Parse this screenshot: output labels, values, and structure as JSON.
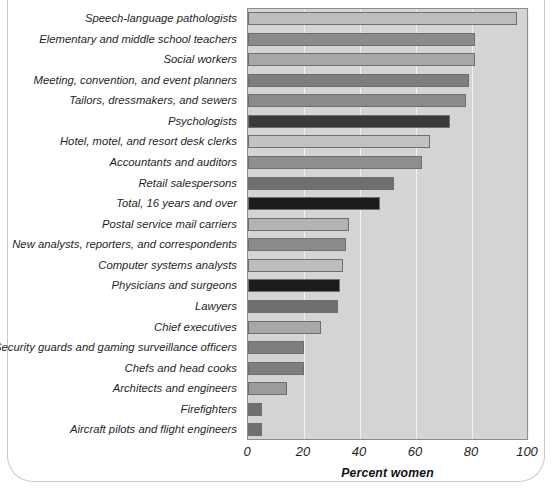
{
  "chart_data": {
    "type": "bar",
    "orientation": "horizontal",
    "title": "",
    "xlabel": "Percent women",
    "ylabel": "",
    "xlim": [
      0,
      100
    ],
    "xticks": [
      "0",
      "20",
      "40",
      "60",
      "80",
      "100"
    ],
    "grid": "vertical",
    "legend": "none",
    "categories": [
      "Speech-language pathologists",
      "Elementary and middle school teachers",
      "Social workers",
      "Meeting, convention, and event planners",
      "Tailors, dressmakers, and sewers",
      "Psychologists",
      "Hotel, motel, and resort desk clerks",
      "Accountants and auditors",
      "Retail salespersons",
      "Total, 16 years and over",
      "Postal service mail carriers",
      "New analysts, reporters, and correspondents",
      "Computer systems analysts",
      "Physicians and surgeons",
      "Lawyers",
      "Chief executives",
      "Security guards and gaming surveillance officers",
      "Chefs and head cooks",
      "Architects and engineers",
      "Firefighters",
      "Aircraft pilots and flight engineers"
    ],
    "values": [
      96,
      81,
      81,
      79,
      78,
      72,
      65,
      62,
      52,
      47,
      36,
      35,
      34,
      33,
      32,
      26,
      20,
      20,
      14,
      5,
      5
    ],
    "bar_colors": [
      "#bdbdbd",
      "#8b8b8b",
      "#a8a8a8",
      "#7e7e7e",
      "#8a8a8a",
      "#3a3a3a",
      "#c2c2c2",
      "#8f8f8f",
      "#6f6f6f",
      "#1c1c1c",
      "#b3b3b3",
      "#8a8a8a",
      "#bdbdbd",
      "#1c1c1c",
      "#6f6f6f",
      "#a8a8a8",
      "#7e7e7e",
      "#7e7e7e",
      "#9b9b9b",
      "#6f6f6f",
      "#6f6f6f"
    ]
  },
  "style": {
    "plot_background": "#d4d4d4",
    "gridline_color": "#f2f2f2",
    "axis_color": "#8d8d8d",
    "text_color": "#1f1f1f"
  }
}
